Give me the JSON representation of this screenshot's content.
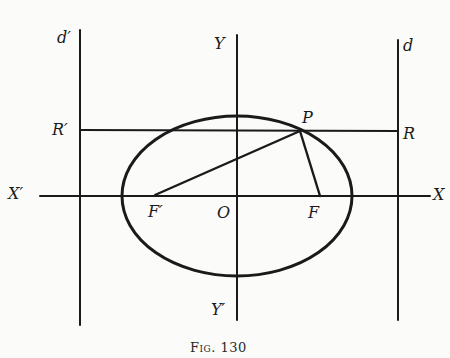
{
  "figure": {
    "caption": "Fig. 130",
    "colors": {
      "ink": "#1a1a1a",
      "background": "#fbfbfa"
    },
    "labels": {
      "d_prime": "d′",
      "d": "d",
      "Y": "Y",
      "Y_prime": "Y′",
      "X": "X",
      "X_prime": "X′",
      "R_prime": "R′",
      "R": "R",
      "P": "P",
      "F_prime": "F′",
      "O": "O",
      "F": "F"
    },
    "geometry": {
      "ellipse": {
        "cx": 237,
        "cy": 196,
        "rx": 115,
        "ry": 80
      },
      "x_axis": {
        "x1": 40,
        "x2": 430,
        "y": 196
      },
      "y_axis": {
        "x": 237,
        "y1": 35,
        "y2": 320
      },
      "directrix_left": {
        "x": 80,
        "y1": 30,
        "y2": 325
      },
      "directrix_right": {
        "x": 398,
        "y1": 40,
        "y2": 320
      },
      "line_RR_prime": {
        "x1": 80,
        "x2": 398,
        "y": 130
      },
      "P": {
        "x": 300,
        "y": 131
      },
      "F_prime": {
        "x": 155,
        "y": 195
      },
      "F": {
        "x": 320,
        "y": 196
      }
    }
  }
}
